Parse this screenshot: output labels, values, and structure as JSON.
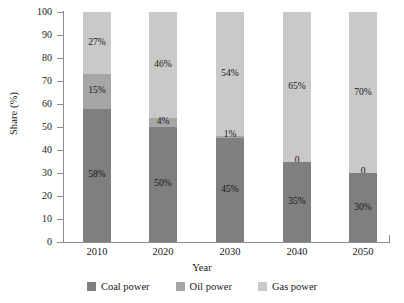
{
  "chart_data": {
    "type": "bar",
    "subtype": "stacked-bar-100",
    "title": "",
    "xlabel": "Year",
    "ylabel": "Share (%)",
    "categories": [
      "2010",
      "2020",
      "2030",
      "2040",
      "2050"
    ],
    "ylim": [
      0,
      100
    ],
    "yticks": [
      0,
      10,
      20,
      30,
      40,
      50,
      60,
      70,
      80,
      90,
      100
    ],
    "ytick_labels": [
      "0",
      "10",
      "20",
      "30",
      "40",
      "50",
      "60",
      "70",
      "80",
      "90",
      "100"
    ],
    "grid": false,
    "legend_position": "bottom",
    "series": [
      {
        "name": "Coal power",
        "color": "#7f7f7f",
        "values": [
          58,
          50,
          45,
          35,
          30
        ],
        "data_labels": [
          "58%",
          "50%",
          "45%",
          "35%",
          "30%"
        ]
      },
      {
        "name": "Oil power",
        "color": "#a6a6a6",
        "values": [
          15,
          4,
          1,
          0,
          0
        ],
        "data_labels": [
          "15%",
          "4%",
          "1%",
          "0",
          "0"
        ]
      },
      {
        "name": "Gas power",
        "color": "#c9c9c9",
        "values": [
          27,
          46,
          54,
          65,
          70
        ],
        "data_labels": [
          "27%",
          "46%",
          "54%",
          "65%",
          "70%"
        ]
      }
    ]
  },
  "axes": {
    "y_title": "Share (%)",
    "x_title": "Year"
  },
  "legend": {
    "items": [
      {
        "label": "Coal power",
        "color": "#7f7f7f"
      },
      {
        "label": "Oil power",
        "color": "#a6a6a6"
      },
      {
        "label": "Gas power",
        "color": "#c9c9c9"
      }
    ]
  }
}
